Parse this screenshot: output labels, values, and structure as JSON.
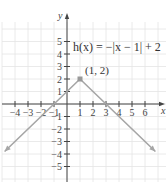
{
  "chart_data": {
    "type": "line",
    "title": "h(x) = −|x − 1| + 2",
    "function": "h(x) = -|x - 1| + 2",
    "xlabel": "x",
    "ylabel": "y",
    "xlim": [
      -5,
      7
    ],
    "ylim": [
      -6,
      6
    ],
    "grid": true,
    "x_ticks": [
      -4,
      -3,
      -2,
      -1,
      1,
      2,
      3,
      4,
      5,
      6
    ],
    "y_ticks": [
      -5,
      -4,
      -3,
      -2,
      -1,
      1,
      2,
      3,
      4,
      5
    ],
    "x_tick_labels": [
      "−4",
      "−3",
      "−2",
      "−1",
      "1",
      "2",
      "3",
      "4",
      "5",
      "6"
    ],
    "y_tick_labels": [
      "−5",
      "−4",
      "−3",
      "−2",
      "−1",
      "1",
      "2",
      "3",
      "4",
      "5"
    ],
    "series": [
      {
        "name": "h(x)",
        "x": [
          -4.8,
          1,
          6.8
        ],
        "y": [
          -3.8,
          2,
          -3.8
        ],
        "arrows": "both-ends",
        "color": "#a6a6a6"
      }
    ],
    "annotations": [
      {
        "text": "(1, 2)",
        "x": 1,
        "y": 2,
        "marker": "square"
      },
      {
        "text": "h(x) = −|x − 1| + 2",
        "position": "upper-right"
      }
    ],
    "colors": {
      "axis": "#444444",
      "grid": "#e4e4e4",
      "curve": "#a6a6a6",
      "point": "#999999"
    }
  }
}
